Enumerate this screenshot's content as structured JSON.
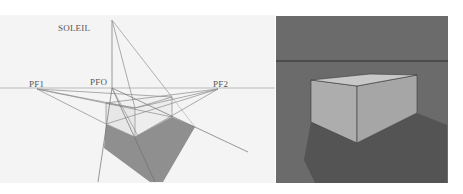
{
  "left_diagram": {
    "title": "Construction de l'ombre en perspective",
    "labels": {
      "sun": "SOLEIL",
      "vanishing_point_1": "PF1",
      "vanishing_point_origin": "PFO",
      "vanishing_point_2": "PF2"
    },
    "colors": {
      "background": "#f4f4f4",
      "construction_lines": "#8a8a8a",
      "box_faces": "#e9e9e9",
      "shadow": "#8f8f8f",
      "text": "#555555"
    }
  },
  "right_render": {
    "title": "Rendu du volume avec ombre portée",
    "colors": {
      "background": "#6b6b6b",
      "horizon_line": "#2e2e2e",
      "box_top": "#c8c8c8",
      "box_left_face": "#adadad",
      "box_right_face": "#a6a6a6",
      "shadow": "#545454",
      "edges": "#3a3a3a"
    }
  }
}
